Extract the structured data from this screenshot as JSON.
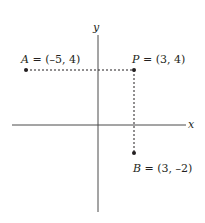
{
  "diagram": {
    "type": "coordinate-plane",
    "axes": {
      "x_label": "x",
      "y_label": "y"
    },
    "points": [
      {
        "name": "A",
        "coords": "(–5, 4)",
        "x": -5,
        "y": 4
      },
      {
        "name": "P",
        "coords": "(3, 4)",
        "x": 3,
        "y": 4
      },
      {
        "name": "B",
        "coords": "(3, –2)",
        "x": 3,
        "y": -2
      }
    ],
    "dashed_segments": [
      {
        "from": "A",
        "to": "P"
      },
      {
        "from": "P",
        "to": "B"
      }
    ],
    "colors": {
      "ink": "#231f20",
      "axis": "#4a4a4a"
    }
  }
}
